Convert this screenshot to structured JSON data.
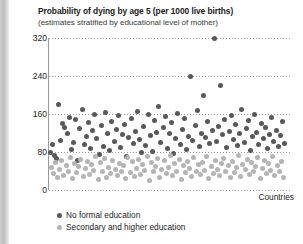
{
  "chart_data": {
    "type": "scatter",
    "title": "Probability of dying by age 5 (per 1000 live births)",
    "subtitle": "(estimates stratified by educational level of mother)",
    "xlabel": "Countries",
    "ylabel": "",
    "ylim": [
      0,
      320
    ],
    "yticks": [
      0,
      80,
      160,
      240,
      320
    ],
    "ytick_labels": [
      "0",
      "80",
      "160",
      "240",
      "320"
    ],
    "grid": true,
    "grid_axis": "y",
    "legend_position": "bottom-left",
    "colors": {
      "no_formal_education": "#585858",
      "secondary_and_higher_education": "#b4b4b4",
      "gridline": "#9e9e9e",
      "axis": "#9a9a9a"
    },
    "series": [
      {
        "name": "No formal education",
        "color": "#585858",
        "points": [
          [
            1,
            78
          ],
          [
            3,
            96
          ],
          [
            5,
            72
          ],
          [
            7,
            66
          ],
          [
            9,
            180
          ],
          [
            11,
            104
          ],
          [
            13,
            140
          ],
          [
            15,
            131
          ],
          [
            17,
            120
          ],
          [
            19,
            152
          ],
          [
            21,
            86
          ],
          [
            23,
            100
          ],
          [
            25,
            148
          ],
          [
            27,
            62
          ],
          [
            29,
            130
          ],
          [
            31,
            170
          ],
          [
            33,
            96
          ],
          [
            35,
            112
          ],
          [
            37,
            142
          ],
          [
            39,
            88
          ],
          [
            41,
            126
          ],
          [
            43,
            158
          ],
          [
            45,
            108
          ],
          [
            47,
            74
          ],
          [
            49,
            136
          ],
          [
            51,
            92
          ],
          [
            53,
            164
          ],
          [
            55,
            118
          ],
          [
            57,
            84
          ],
          [
            59,
            144
          ],
          [
            61,
            102
          ],
          [
            63,
            128
          ],
          [
            65,
            156
          ],
          [
            67,
            90
          ],
          [
            69,
            116
          ],
          [
            71,
            138
          ],
          [
            73,
            70
          ],
          [
            75,
            110
          ],
          [
            77,
            150
          ],
          [
            79,
            98
          ],
          [
            81,
            124
          ],
          [
            83,
            166
          ],
          [
            85,
            106
          ],
          [
            87,
            80
          ],
          [
            89,
            134
          ],
          [
            91,
            94
          ],
          [
            93,
            160
          ],
          [
            95,
            114
          ],
          [
            97,
            82
          ],
          [
            99,
            146
          ],
          [
            101,
            122
          ],
          [
            103,
            176
          ],
          [
            105,
            100
          ],
          [
            107,
            132
          ],
          [
            109,
            154
          ],
          [
            111,
            88
          ],
          [
            113,
            118
          ],
          [
            115,
            142
          ],
          [
            117,
            76
          ],
          [
            119,
            108
          ],
          [
            121,
            162
          ],
          [
            123,
            96
          ],
          [
            125,
            128
          ],
          [
            127,
            150
          ],
          [
            129,
            86
          ],
          [
            131,
            112
          ],
          [
            133,
            240
          ],
          [
            135,
            104
          ],
          [
            137,
            136
          ],
          [
            139,
            168
          ],
          [
            141,
            92
          ],
          [
            143,
            120
          ],
          [
            145,
            200
          ],
          [
            147,
            110
          ],
          [
            149,
            144
          ],
          [
            151,
            98
          ],
          [
            153,
            126
          ],
          [
            155,
            320
          ],
          [
            157,
            102
          ],
          [
            159,
            134
          ],
          [
            161,
            220
          ],
          [
            163,
            116
          ],
          [
            165,
            148
          ],
          [
            167,
            90
          ],
          [
            169,
            124
          ],
          [
            171,
            156
          ],
          [
            173,
            106
          ],
          [
            175,
            138
          ],
          [
            177,
            94
          ],
          [
            179,
            118
          ],
          [
            181,
            170
          ],
          [
            183,
            100
          ],
          [
            185,
            130
          ],
          [
            187,
            146
          ],
          [
            189,
            84
          ],
          [
            191,
            112
          ],
          [
            193,
            158
          ],
          [
            195,
            122
          ],
          [
            197,
            96
          ],
          [
            199,
            140
          ],
          [
            201,
            108
          ],
          [
            203,
            132
          ],
          [
            205,
            88
          ],
          [
            207,
            116
          ],
          [
            209,
            152
          ],
          [
            211,
            102
          ],
          [
            213,
            126
          ],
          [
            215,
            92
          ],
          [
            217,
            114
          ],
          [
            219,
            144
          ],
          [
            221,
            98
          ]
        ]
      },
      {
        "name": "Secondary and higher education",
        "color": "#b4b4b4",
        "points": [
          [
            2,
            48
          ],
          [
            4,
            34
          ],
          [
            6,
            58
          ],
          [
            8,
            26
          ],
          [
            10,
            44
          ],
          [
            12,
            62
          ],
          [
            14,
            30
          ],
          [
            16,
            52
          ],
          [
            18,
            40
          ],
          [
            20,
            68
          ],
          [
            22,
            24
          ],
          [
            24,
            56
          ],
          [
            26,
            36
          ],
          [
            28,
            50
          ],
          [
            30,
            64
          ],
          [
            32,
            28
          ],
          [
            34,
            46
          ],
          [
            36,
            60
          ],
          [
            38,
            32
          ],
          [
            40,
            54
          ],
          [
            42,
            42
          ],
          [
            44,
            70
          ],
          [
            46,
            22
          ],
          [
            48,
            58
          ],
          [
            50,
            38
          ],
          [
            52,
            66
          ],
          [
            54,
            26
          ],
          [
            56,
            48
          ],
          [
            58,
            34
          ],
          [
            60,
            62
          ],
          [
            62,
            44
          ],
          [
            64,
            30
          ],
          [
            66,
            56
          ],
          [
            68,
            40
          ],
          [
            70,
            52
          ],
          [
            72,
            24
          ],
          [
            74,
            68
          ],
          [
            76,
            36
          ],
          [
            78,
            60
          ],
          [
            80,
            28
          ],
          [
            82,
            46
          ],
          [
            84,
            64
          ],
          [
            86,
            32
          ],
          [
            88,
            54
          ],
          [
            90,
            42
          ],
          [
            92,
            70
          ],
          [
            94,
            20
          ],
          [
            96,
            58
          ],
          [
            98,
            38
          ],
          [
            100,
            50
          ],
          [
            102,
            66
          ],
          [
            104,
            26
          ],
          [
            106,
            44
          ],
          [
            108,
            62
          ],
          [
            110,
            34
          ],
          [
            112,
            48
          ],
          [
            114,
            72
          ],
          [
            116,
            30
          ],
          [
            118,
            56
          ],
          [
            120,
            40
          ],
          [
            122,
            64
          ],
          [
            124,
            22
          ],
          [
            126,
            52
          ],
          [
            128,
            36
          ],
          [
            130,
            60
          ],
          [
            132,
            46
          ],
          [
            134,
            28
          ],
          [
            136,
            68
          ],
          [
            138,
            38
          ],
          [
            140,
            54
          ],
          [
            142,
            32
          ],
          [
            144,
            58
          ],
          [
            146,
            42
          ],
          [
            148,
            70
          ],
          [
            150,
            24
          ],
          [
            152,
            50
          ],
          [
            154,
            34
          ],
          [
            156,
            62
          ],
          [
            158,
            44
          ],
          [
            160,
            30
          ],
          [
            162,
            56
          ],
          [
            164,
            66
          ],
          [
            166,
            40
          ],
          [
            168,
            52
          ],
          [
            170,
            26
          ],
          [
            172,
            60
          ],
          [
            174,
            36
          ],
          [
            176,
            48
          ],
          [
            178,
            72
          ],
          [
            180,
            28
          ],
          [
            182,
            54
          ],
          [
            184,
            44
          ],
          [
            186,
            64
          ],
          [
            188,
            32
          ],
          [
            190,
            58
          ],
          [
            192,
            38
          ],
          [
            194,
            50
          ],
          [
            196,
            68
          ],
          [
            198,
            24
          ],
          [
            200,
            46
          ],
          [
            202,
            62
          ],
          [
            204,
            34
          ],
          [
            206,
            56
          ],
          [
            208,
            42
          ],
          [
            210,
            70
          ],
          [
            212,
            30
          ],
          [
            214,
            52
          ],
          [
            216,
            40
          ],
          [
            218,
            60
          ],
          [
            220,
            26
          ]
        ]
      }
    ]
  },
  "legend": {
    "items": [
      {
        "label": "No formal education",
        "marker": "dark"
      },
      {
        "label": "Secondary and higher education",
        "marker": "light"
      }
    ]
  }
}
